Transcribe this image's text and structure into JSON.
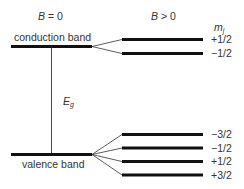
{
  "diagram": {
    "type": "energy-level (Zeeman splitting)",
    "headers": {
      "left": "B = 0",
      "right": "B > 0",
      "left_var": "B",
      "left_rel": " = 0",
      "right_var": "B",
      "right_rel": " > 0"
    },
    "column_label": {
      "symbol": "m",
      "subscript": "j"
    },
    "conduction_band": {
      "label": "conduction band",
      "sublevels": [
        "+1/2",
        "−1/2"
      ]
    },
    "valence_band": {
      "label": "valence band",
      "sublevels": [
        "−3/2",
        "−1/2",
        "+1/2",
        "+3/2"
      ]
    },
    "gap": {
      "symbol": "E",
      "subscript": "g"
    },
    "colors": {
      "line": "#111111",
      "text": "#333333"
    }
  }
}
